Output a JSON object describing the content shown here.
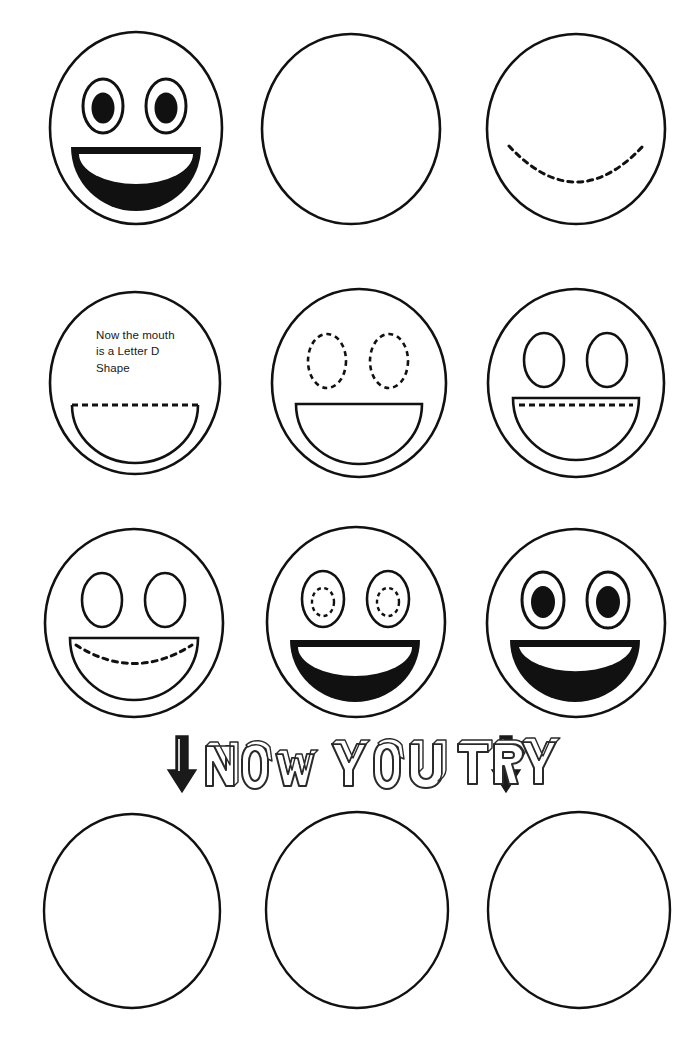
{
  "worksheet": {
    "title": "Draw a Smiley Face - Step by Step Tracing Worksheet",
    "page_width": 700,
    "page_height": 1060,
    "ink_color": "#111111",
    "paper_color": "#ffffff",
    "instruction_banner": {
      "text": "NOW YOU TRY",
      "left_icon": "down-arrow-icon",
      "right_icon": "down-arrow-icon"
    },
    "caption": {
      "text": "Now the mouth\nis a Letter  D\nShape",
      "lines": [
        "Now the mouth",
        "is a Letter  D",
        "Shape"
      ]
    },
    "rows": [
      {
        "row_index": 1,
        "cells": [
          {
            "label": "completed-smiley-face",
            "eyes": "filled-oval-eyes",
            "mouth": "filled-open-smile",
            "state": "example"
          },
          {
            "label": "empty-face-outline",
            "eyes": "none",
            "mouth": "none",
            "state": "blank"
          },
          {
            "label": "dashed-smile-guide",
            "eyes": "none",
            "mouth": "dashed-u-curve",
            "state": "trace"
          }
        ]
      },
      {
        "row_index": 2,
        "cells": [
          {
            "label": "letter-d-mouth-step",
            "eyes": "none",
            "mouth": "d-shape-dashed-top",
            "state": "trace",
            "has_caption": true
          },
          {
            "label": "dashed-oval-eyes-step",
            "eyes": "dashed-oval-eyes",
            "mouth": "d-shape-outline",
            "state": "trace"
          },
          {
            "label": "dashed-lip-line-step",
            "eyes": "outline-oval-eyes",
            "mouth": "d-shape-dashed-lip",
            "state": "trace"
          }
        ]
      },
      {
        "row_index": 3,
        "cells": [
          {
            "label": "dashed-teeth-curve-step",
            "eyes": "outline-oval-eyes",
            "mouth": "d-shape-dashed-curve",
            "state": "trace"
          },
          {
            "label": "dashed-pupils-step",
            "eyes": "dashed-pupil-eyes",
            "mouth": "filled-open-smile",
            "state": "trace"
          },
          {
            "label": "completed-smiley-face",
            "eyes": "filled-oval-eyes",
            "mouth": "filled-open-smile",
            "state": "example"
          }
        ]
      },
      {
        "row_index": 4,
        "cells": [
          {
            "label": "practice-face-outline",
            "eyes": "none",
            "mouth": "none",
            "state": "blank"
          },
          {
            "label": "practice-face-outline",
            "eyes": "none",
            "mouth": "none",
            "state": "blank"
          },
          {
            "label": "practice-face-outline",
            "eyes": "none",
            "mouth": "none",
            "state": "blank"
          }
        ]
      }
    ]
  }
}
